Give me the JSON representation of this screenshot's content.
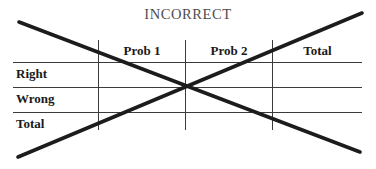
{
  "figure": {
    "title": "INCORRECT",
    "annotation": "cross-out-x",
    "title_color": "#4d4d4d",
    "rule_color": "#3b3b3b",
    "text_color": "#1a1a1a",
    "crossout_color": "#1c1c1c",
    "background_color": "#ffffff"
  },
  "table": {
    "corner_label": "",
    "column_headers": [
      "Prob 1",
      "Prob 2",
      "Total"
    ],
    "row_headers": [
      "Right",
      "Wrong",
      "Total"
    ],
    "cells": [
      [
        "",
        "",
        ""
      ],
      [
        "",
        "",
        ""
      ],
      [
        "",
        "",
        ""
      ]
    ]
  }
}
